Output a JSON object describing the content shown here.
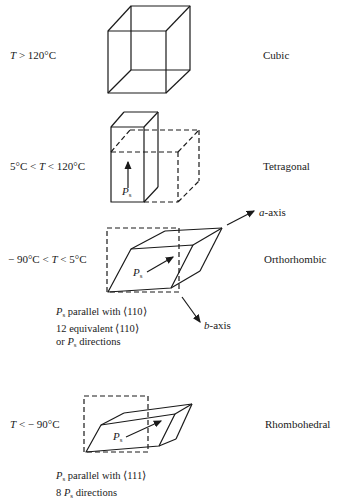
{
  "diagram": {
    "stages": [
      {
        "temperature": "T > 120°C",
        "temp_parts": {
          "var": "T",
          "rel": "> 120°C"
        },
        "phase": "Cubic"
      },
      {
        "temperature": "5°C < T < 120°C",
        "temp_parts": {
          "pre": "5°C < ",
          "var": "T",
          "rel": " < 120°C"
        },
        "phase": "Tetragonal",
        "vector_label": {
          "var": "P",
          "sub": "s"
        }
      },
      {
        "temperature": "−90°C < T < 5°C",
        "temp_parts": {
          "pre": "− 90°C < ",
          "var": "T",
          "rel": " < 5°C"
        },
        "phase": "Orthorhombic",
        "vector_label": {
          "var": "P",
          "sub": "s"
        },
        "axes": {
          "a": {
            "var": "a",
            "rest": "-axis"
          },
          "b": {
            "var": "b",
            "rest": "-axis"
          }
        },
        "notes": {
          "line1": {
            "var": "P",
            "sub": "s",
            "rest": " parallel with ⟨110⟩"
          },
          "line2": "12 equivalent ⟨110⟩",
          "line3": {
            "pre": "or ",
            "var": "P",
            "sub": "s",
            "rest": " directions"
          }
        }
      },
      {
        "temperature": "T < −90°C",
        "temp_parts": {
          "var": "T",
          "rel": " < − 90°C"
        },
        "phase": "Rhombohedral",
        "vector_label": {
          "var": "P",
          "sub": "s"
        },
        "notes": {
          "line1": {
            "var": "P",
            "sub": "s",
            "rest": " parallel with ⟨111⟩"
          },
          "line2": {
            "pre": "8 ",
            "var": "P",
            "sub": "s",
            "rest": " directions"
          }
        }
      }
    ],
    "colors": {
      "ink": "#1a1a1a",
      "background": "#ffffff"
    }
  }
}
